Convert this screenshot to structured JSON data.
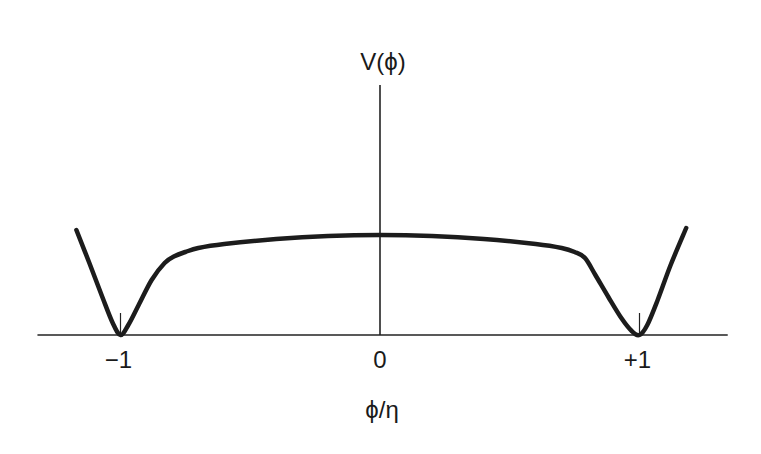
{
  "chart_data": {
    "type": "line",
    "title": "",
    "xlabel": "ϕ/η",
    "ylabel": "V(ϕ)",
    "xlim": [
      -1.17,
      1.34
    ],
    "x_axis_start": -1.32,
    "ylim": [
      0,
      1.0
    ],
    "x_ticks": [
      {
        "value": -1,
        "label": "−1"
      },
      {
        "value": 0,
        "label": "0"
      },
      {
        "value": 1,
        "label": "+1"
      }
    ],
    "grid": false,
    "legend": "none",
    "series": [
      {
        "name": "V(ϕ)",
        "x": [
          -1.17,
          -1.12,
          -1.07,
          -1.03,
          -1.0,
          -0.97,
          -0.93,
          -0.88,
          -0.83,
          -0.79,
          -0.75,
          -0.7,
          -0.6,
          -0.4,
          -0.2,
          0.0,
          0.2,
          0.4,
          0.6,
          0.7,
          0.75,
          0.79,
          0.83,
          0.88,
          0.93,
          0.97,
          1.0,
          1.03,
          1.07,
          1.12,
          1.18
        ],
        "y": [
          1.05,
          0.72,
          0.38,
          0.12,
          0.0,
          0.1,
          0.3,
          0.55,
          0.72,
          0.79,
          0.83,
          0.87,
          0.91,
          0.96,
          0.99,
          1.0,
          0.99,
          0.96,
          0.91,
          0.87,
          0.83,
          0.77,
          0.6,
          0.38,
          0.17,
          0.04,
          0.0,
          0.1,
          0.35,
          0.7,
          1.07
        ]
      }
    ],
    "annotations": [
      {
        "type": "tick-mark",
        "x": -1
      },
      {
        "type": "tick-mark",
        "x": 1
      }
    ]
  }
}
